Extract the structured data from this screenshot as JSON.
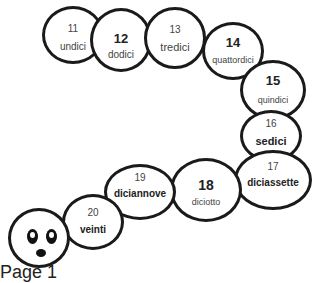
{
  "caterpillar": {
    "segments": [
      {
        "number": "11",
        "word": "undici"
      },
      {
        "number": "12",
        "word": "dodici"
      },
      {
        "number": "13",
        "word": "tredici"
      },
      {
        "number": "14",
        "word": "quattordici"
      },
      {
        "number": "15",
        "word": "quindici"
      },
      {
        "number": "16",
        "word": "sedici"
      },
      {
        "number": "17",
        "word": "diciassette"
      },
      {
        "number": "18",
        "word": "diciotto"
      },
      {
        "number": "19",
        "word": "diciannove"
      },
      {
        "number": "20",
        "word": "veinti"
      }
    ]
  },
  "footer": {
    "label": "Page 1"
  }
}
